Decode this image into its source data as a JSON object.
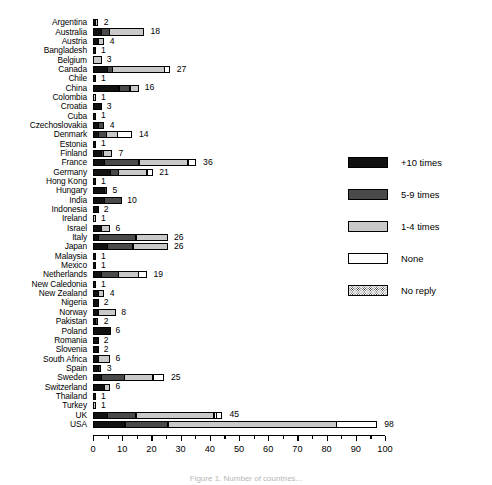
{
  "caption": "Figure 1. Number of countries...",
  "colors": {
    "plus10": "#111111",
    "five_to_nine": "#4a4a4a",
    "one_to_four": "#c9c9c9",
    "none": "#ffffff",
    "no_reply": "#ffffff"
  },
  "legend": {
    "items": [
      {
        "label": "+10 times",
        "key": "plus10"
      },
      {
        "label": "5-9 times",
        "key": "five_to_nine"
      },
      {
        "label": "1-4 times",
        "key": "one_to_four"
      },
      {
        "label": "None",
        "key": "none"
      },
      {
        "label": "No reply",
        "key": "no_reply"
      }
    ]
  },
  "chart_data": {
    "type": "bar",
    "orientation": "horizontal",
    "stacked": true,
    "title": "",
    "xlabel": "",
    "ylabel": "",
    "xlim": [
      0,
      100
    ],
    "xticks": [
      0,
      10,
      20,
      30,
      40,
      50,
      60,
      70,
      80,
      90,
      100
    ],
    "xtick_labels": [
      "0",
      "10",
      "20",
      "30",
      "40",
      "50",
      "60",
      "70",
      "80",
      "90",
      "100"
    ],
    "minor_tick_step": 5,
    "grid": false,
    "legend_position": "right",
    "series": [
      {
        "name": "+10 times"
      },
      {
        "name": "5-9 times"
      },
      {
        "name": "1-4 times"
      },
      {
        "name": "None"
      },
      {
        "name": "No reply"
      }
    ],
    "categories": [
      "Argentina",
      "Australia",
      "Austria",
      "Bangladesh",
      "Belgium",
      "Canada",
      "Chile",
      "China",
      "Colombia",
      "Croatia",
      "Cuba",
      "Czechoslovakia",
      "Denmark",
      "Estonia",
      "Finland",
      "France",
      "Germany",
      "Hong Kong",
      "Hungary",
      "India",
      "Indonesia",
      "Ireland",
      "Israel",
      "Italy",
      "Japan",
      "Malaysia",
      "Mexico",
      "Netherlands",
      "New Caledonia",
      "New Zealand",
      "Nigeria",
      "Norway",
      "Pakistan",
      "Poland",
      "Romania",
      "Slovenia",
      "South Africa",
      "Spain",
      "Sweden",
      "Switzerland",
      "Thailand",
      "Turkey",
      "UK",
      "USA"
    ],
    "totals": [
      2,
      18,
      4,
      1,
      3,
      27,
      1,
      16,
      1,
      3,
      1,
      4,
      14,
      1,
      7,
      36,
      21,
      1,
      5,
      10,
      2,
      1,
      6,
      26,
      26,
      1,
      1,
      19,
      1,
      4,
      2,
      8,
      2,
      6,
      2,
      2,
      6,
      3,
      25,
      6,
      1,
      1,
      45,
      98
    ],
    "rows": [
      {
        "category": "Argentina",
        "total": 2,
        "segments": [
          1,
          0,
          1,
          0,
          0
        ]
      },
      {
        "category": "Australia",
        "total": 18,
        "segments": [
          3,
          3,
          12,
          0,
          0
        ]
      },
      {
        "category": "Austria",
        "total": 4,
        "segments": [
          2,
          0,
          2,
          0,
          0
        ]
      },
      {
        "category": "Bangladesh",
        "total": 1,
        "segments": [
          1,
          0,
          0,
          0,
          0
        ]
      },
      {
        "category": "Belgium",
        "total": 3,
        "segments": [
          0,
          0,
          3,
          0,
          0
        ]
      },
      {
        "category": "Canada",
        "total": 27,
        "segments": [
          5,
          2,
          18,
          0,
          2
        ]
      },
      {
        "category": "Chile",
        "total": 1,
        "segments": [
          1,
          0,
          0,
          0,
          0
        ]
      },
      {
        "category": "China",
        "total": 16,
        "segments": [
          9,
          4,
          3,
          0,
          0
        ]
      },
      {
        "category": "Colombia",
        "total": 1,
        "segments": [
          0,
          0,
          1,
          0,
          0
        ]
      },
      {
        "category": "Croatia",
        "total": 3,
        "segments": [
          3,
          0,
          0,
          0,
          0
        ]
      },
      {
        "category": "Cuba",
        "total": 1,
        "segments": [
          1,
          0,
          0,
          0,
          0
        ]
      },
      {
        "category": "Czechoslovakia",
        "total": 4,
        "segments": [
          2,
          2,
          0,
          0,
          0
        ]
      },
      {
        "category": "Denmark",
        "total": 14,
        "segments": [
          2,
          3,
          4,
          5,
          0
        ]
      },
      {
        "category": "Estonia",
        "total": 1,
        "segments": [
          1,
          0,
          0,
          0,
          0
        ]
      },
      {
        "category": "Finland",
        "total": 7,
        "segments": [
          3,
          1,
          3,
          0,
          0
        ]
      },
      {
        "category": "France",
        "total": 36,
        "segments": [
          4,
          12,
          17,
          3,
          0
        ]
      },
      {
        "category": "Germany",
        "total": 21,
        "segments": [
          6,
          3,
          10,
          0,
          2
        ]
      },
      {
        "category": "Hong Kong",
        "total": 1,
        "segments": [
          1,
          0,
          0,
          0,
          0
        ]
      },
      {
        "category": "Hungary",
        "total": 5,
        "segments": [
          4,
          1,
          0,
          0,
          0
        ]
      },
      {
        "category": "India",
        "total": 10,
        "segments": [
          4,
          6,
          0,
          0,
          0
        ]
      },
      {
        "category": "Indonesia",
        "total": 2,
        "segments": [
          2,
          0,
          0,
          0,
          0
        ]
      },
      {
        "category": "Ireland",
        "total": 1,
        "segments": [
          0,
          0,
          1,
          0,
          0
        ]
      },
      {
        "category": "Israel",
        "total": 6,
        "segments": [
          3,
          0,
          3,
          0,
          0
        ]
      },
      {
        "category": "Italy",
        "total": 26,
        "segments": [
          2,
          13,
          11,
          0,
          0
        ]
      },
      {
        "category": "Japan",
        "total": 26,
        "segments": [
          5,
          9,
          12,
          0,
          0
        ]
      },
      {
        "category": "Malaysia",
        "total": 1,
        "segments": [
          1,
          0,
          0,
          0,
          0
        ]
      },
      {
        "category": "Mexico",
        "total": 1,
        "segments": [
          1,
          0,
          0,
          0,
          0
        ]
      },
      {
        "category": "Netherlands",
        "total": 19,
        "segments": [
          3,
          6,
          7,
          3,
          0
        ]
      },
      {
        "category": "New Caledonia",
        "total": 1,
        "segments": [
          1,
          0,
          0,
          0,
          0
        ]
      },
      {
        "category": "New Zealand",
        "total": 4,
        "segments": [
          2,
          0,
          2,
          0,
          0
        ]
      },
      {
        "category": "Nigeria",
        "total": 2,
        "segments": [
          2,
          0,
          0,
          0,
          0
        ]
      },
      {
        "category": "Norway",
        "total": 8,
        "segments": [
          2,
          0,
          6,
          0,
          0
        ]
      },
      {
        "category": "Pakistan",
        "total": 2,
        "segments": [
          1,
          1,
          0,
          0,
          0
        ]
      },
      {
        "category": "Poland",
        "total": 6,
        "segments": [
          6,
          0,
          0,
          0,
          0
        ]
      },
      {
        "category": "Romania",
        "total": 2,
        "segments": [
          2,
          0,
          0,
          0,
          0
        ]
      },
      {
        "category": "Slovenia",
        "total": 2,
        "segments": [
          2,
          0,
          0,
          0,
          0
        ]
      },
      {
        "category": "South Africa",
        "total": 6,
        "segments": [
          2,
          0,
          4,
          0,
          0
        ]
      },
      {
        "category": "Spain",
        "total": 3,
        "segments": [
          2,
          1,
          0,
          0,
          0
        ]
      },
      {
        "category": "Sweden",
        "total": 25,
        "segments": [
          3,
          8,
          10,
          4,
          0
        ]
      },
      {
        "category": "Switzerland",
        "total": 6,
        "segments": [
          4,
          0,
          2,
          0,
          0
        ]
      },
      {
        "category": "Thailand",
        "total": 1,
        "segments": [
          1,
          0,
          0,
          0,
          0
        ]
      },
      {
        "category": "Turkey",
        "total": 1,
        "segments": [
          0,
          0,
          1,
          0,
          0
        ]
      },
      {
        "category": "UK",
        "total": 45,
        "segments": [
          5,
          10,
          27,
          1,
          2
        ]
      },
      {
        "category": "USA",
        "total": 98,
        "segments": [
          11,
          15,
          58,
          14,
          0
        ]
      }
    ]
  }
}
